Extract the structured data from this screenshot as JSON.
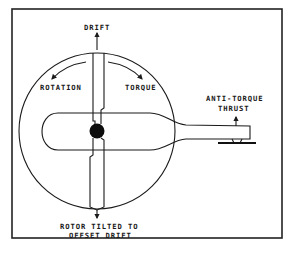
{
  "diagram": {
    "labels": {
      "drift": "DRIFT",
      "rotation": "ROTATION",
      "torque": "TORQUE",
      "anti_torque_line1": "ANTI-TORQUE",
      "anti_torque_line2": "THRUST",
      "rotor_tilted_line1": "ROTOR TILTED TO",
      "rotor_tilted_line2": "OFFSET DRIFT"
    },
    "components": [
      "frame",
      "rotor-disc-circle",
      "main-rotor-blade",
      "rotor-hub",
      "fuselage",
      "tail-boom",
      "tail-rotor"
    ],
    "arrows": [
      "drift-arrow",
      "rotation-arrow",
      "torque-arrow",
      "anti-torque-thrust-arrow",
      "rotor-tilt-arrow"
    ],
    "colors": {
      "ink": "#1a1a1a",
      "background": "#ffffff"
    }
  }
}
